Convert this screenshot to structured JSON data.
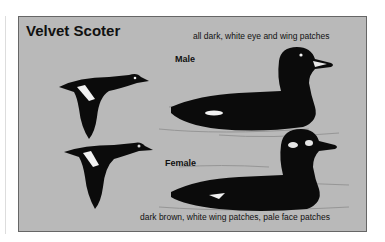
{
  "title": "Velvet Scoter",
  "male": {
    "label": "Male",
    "caption": "all dark, white eye and wing patches"
  },
  "female": {
    "label": "Female",
    "caption": "dark brown, white wing patches, pale face patches"
  },
  "colors": {
    "background": "#b9b9b9",
    "bird": "#0b0b0b",
    "patch": "#f2f2f2"
  }
}
